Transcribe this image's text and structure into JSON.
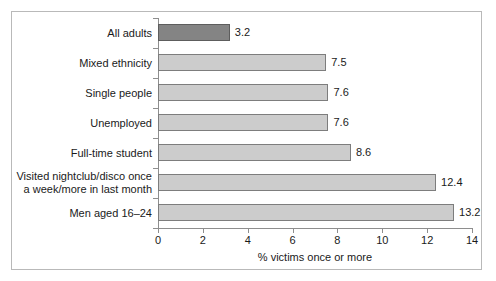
{
  "chart_data": {
    "type": "bar",
    "orientation": "horizontal",
    "title": "",
    "xlabel": "% victims once or more",
    "ylabel": "",
    "xlim": [
      0,
      14
    ],
    "xticks": [
      0,
      2,
      4,
      6,
      8,
      10,
      12,
      14
    ],
    "xtick_labels": [
      "0",
      "2",
      "4",
      "6",
      "8",
      "10",
      "12",
      "14"
    ],
    "grid": false,
    "legend": null,
    "categories": [
      "All adults",
      "Mixed ethnicity",
      "Single people",
      "Unemployed",
      "Full-time student",
      "Visited nightclub/disco once\na week/more in last month",
      "Men aged 16–24"
    ],
    "values": [
      3.2,
      7.5,
      7.6,
      7.6,
      8.6,
      12.4,
      13.2
    ],
    "value_labels": [
      "3.2",
      "7.5",
      "7.6",
      "7.6",
      "8.6",
      "12.4",
      "13.2"
    ],
    "bar_colors": [
      "#848484",
      "#cccccc",
      "#cccccc",
      "#cccccc",
      "#cccccc",
      "#cccccc",
      "#cccccc"
    ],
    "highlight_index": 0,
    "colors": {
      "highlight_bar": "#848484",
      "default_bar": "#cccccc",
      "bar_border": "#7d7d7d",
      "axis": "#8e8e8e",
      "text": "#1a1a1a",
      "frame": "#b9b9b9",
      "background": "#ffffff"
    }
  }
}
